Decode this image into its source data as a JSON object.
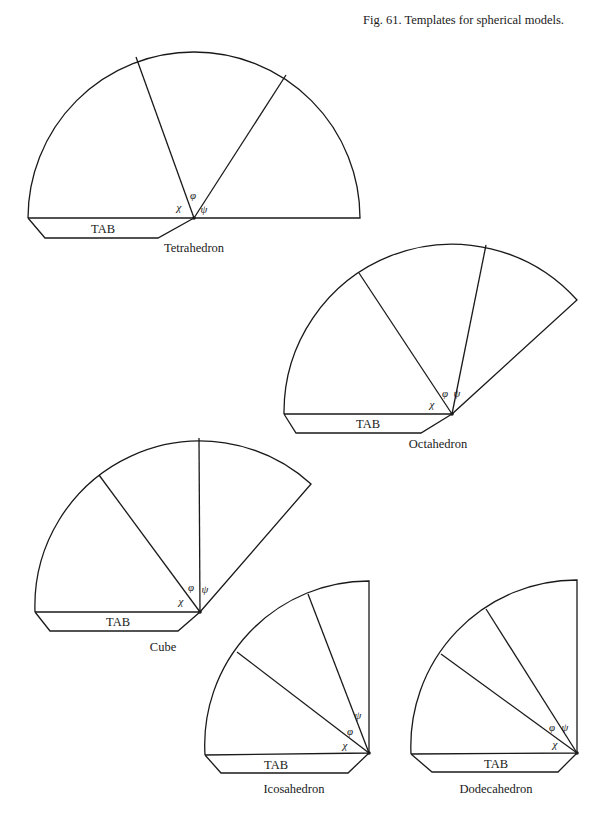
{
  "figure": {
    "caption": "Fig. 61. Templates for spherical models."
  },
  "symbols": {
    "chi": "χ",
    "phi": "φ",
    "psi": "ψ"
  },
  "tab_label": "TAB",
  "templates": [
    {
      "name": "Tetrahedron",
      "center": [
        194,
        218
      ],
      "left": [
        28,
        218
      ],
      "end": [
        360,
        218
      ],
      "radius": 166,
      "spokes": [
        [
          136,
          57
        ],
        [
          286,
          75
        ]
      ],
      "tab": [
        [
          28,
          218
        ],
        [
          45,
          238
        ],
        [
          158,
          238
        ],
        [
          194,
          218
        ]
      ],
      "tab_label_pos": [
        103,
        233
      ],
      "name_pos": [
        194,
        252
      ],
      "chi_pos": [
        179,
        211
      ],
      "phi_pos": [
        193,
        199
      ],
      "psi_pos": [
        204,
        213
      ]
    },
    {
      "name": "Octahedron",
      "center": [
        452,
        414
      ],
      "left": [
        284,
        414
      ],
      "end": [
        577,
        300
      ],
      "radius": 168,
      "spokes": [
        [
          359,
          273
        ],
        [
          486,
          245
        ]
      ],
      "tab": [
        [
          284,
          414
        ],
        [
          296,
          433
        ],
        [
          421,
          433
        ],
        [
          452,
          414
        ]
      ],
      "tab_label_pos": [
        368,
        428
      ],
      "name_pos": [
        438,
        448
      ],
      "chi_pos": [
        432,
        408
      ],
      "phi_pos": [
        445,
        397
      ],
      "psi_pos": [
        457,
        397
      ]
    },
    {
      "name": "Cube",
      "center": [
        200,
        612
      ],
      "left": [
        35,
        612
      ],
      "end": [
        311,
        484
      ],
      "radius": 165,
      "spokes": [
        [
          99,
          475
        ],
        [
          199,
          438
        ]
      ],
      "tab": [
        [
          35,
          612
        ],
        [
          50,
          631
        ],
        [
          178,
          631
        ],
        [
          200,
          612
        ]
      ],
      "tab_label_pos": [
        118,
        626
      ],
      "name_pos": [
        163,
        651
      ],
      "chi_pos": [
        181,
        605
      ],
      "phi_pos": [
        191,
        591
      ],
      "psi_pos": [
        205,
        593
      ]
    },
    {
      "name": "Icosahedron",
      "center": [
        369,
        753
      ],
      "left": [
        205,
        755
      ],
      "end": [
        369,
        581
      ],
      "radius": 164,
      "spokes": [
        [
          237,
          652
        ],
        [
          308,
          594
        ]
      ],
      "tab": [
        [
          205,
          755
        ],
        [
          221,
          773
        ],
        [
          348,
          773
        ],
        [
          369,
          753
        ]
      ],
      "tab_label_pos": [
        276,
        769
      ],
      "name_pos": [
        294,
        793
      ],
      "chi_pos": [
        345,
        749
      ],
      "phi_pos": [
        350,
        735
      ],
      "psi_pos": [
        358,
        719
      ]
    },
    {
      "name": "Dodecahedron",
      "center": [
        577,
        753
      ],
      "left": [
        411,
        754
      ],
      "end": [
        577,
        580
      ],
      "radius": 166,
      "spokes": [
        [
          441,
          654
        ],
        [
          486,
          609
        ]
      ],
      "tab": [
        [
          411,
          754
        ],
        [
          432,
          772
        ],
        [
          558,
          772
        ],
        [
          577,
          753
        ]
      ],
      "tab_label_pos": [
        496,
        768
      ],
      "name_pos": [
        496,
        793
      ],
      "chi_pos": [
        555,
        748
      ],
      "phi_pos": [
        552,
        731
      ],
      "psi_pos": [
        565,
        731
      ]
    }
  ]
}
